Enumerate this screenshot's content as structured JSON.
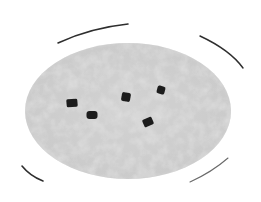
{
  "image": {
    "subject": "petri dish with dark particles on agar",
    "colors": {
      "background": "#ffffff",
      "agar": "#d2d2d2",
      "agar_light": "#e6e6e6",
      "agar_dark": "#b8b8b8",
      "rim": "#2e2e2e",
      "particle": "#1c1c1c"
    },
    "dish": {
      "cx": 128,
      "cy": 111,
      "rx": 103,
      "ry": 68
    },
    "particles": [
      {
        "x": 72,
        "y": 103,
        "w": 11,
        "h": 8,
        "rotate": -5
      },
      {
        "x": 92,
        "y": 115,
        "w": 11,
        "h": 8,
        "rotate": 0
      },
      {
        "x": 126,
        "y": 97,
        "w": 9,
        "h": 9,
        "rotate": 10
      },
      {
        "x": 161,
        "y": 90,
        "w": 8,
        "h": 8,
        "rotate": 15
      },
      {
        "x": 148,
        "y": 122,
        "w": 10,
        "h": 8,
        "rotate": -25
      }
    ]
  }
}
